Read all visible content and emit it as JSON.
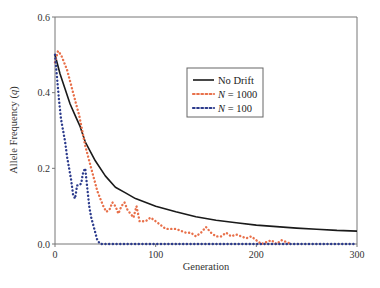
{
  "chart_data": {
    "type": "line",
    "title": "",
    "xlabel": "Generation",
    "ylabel": "Allele Frequency (q)",
    "xlim": [
      0,
      300
    ],
    "ylim": [
      0,
      0.6
    ],
    "x_ticks": [
      "0",
      "100",
      "200",
      "300"
    ],
    "y_ticks": [
      "0.0",
      "0.2",
      "0.4",
      "0.6"
    ],
    "grid": false,
    "legend_position": "upper-center-right",
    "series": [
      {
        "name": "No Drift",
        "style": "solid",
        "color": "#1a1a1a",
        "x": [
          0,
          5,
          10,
          15,
          20,
          25,
          30,
          40,
          50,
          60,
          70,
          80,
          100,
          120,
          140,
          160,
          180,
          200,
          220,
          240,
          260,
          280,
          300
        ],
        "values": [
          0.5,
          0.45,
          0.41,
          0.37,
          0.34,
          0.31,
          0.27,
          0.22,
          0.18,
          0.15,
          0.135,
          0.12,
          0.1,
          0.085,
          0.072,
          0.063,
          0.056,
          0.05,
          0.046,
          0.042,
          0.039,
          0.036,
          0.034
        ]
      },
      {
        "name": "N = 1000",
        "style": "dotted",
        "color": "#e8704a",
        "x": [
          0,
          3,
          6,
          9,
          12,
          15,
          18,
          21,
          24,
          27,
          30,
          33,
          36,
          39,
          42,
          45,
          48,
          51,
          54,
          57,
          60,
          63,
          66,
          69,
          72,
          75,
          78,
          81,
          84,
          87,
          90,
          95,
          100,
          105,
          110,
          115,
          120,
          125,
          130,
          135,
          140,
          145,
          150,
          155,
          160,
          165,
          170,
          175,
          180,
          185,
          190,
          195,
          200,
          205,
          210,
          215,
          220,
          225,
          230,
          235
        ],
        "values": [
          0.48,
          0.51,
          0.5,
          0.48,
          0.46,
          0.43,
          0.4,
          0.37,
          0.34,
          0.3,
          0.26,
          0.23,
          0.2,
          0.17,
          0.14,
          0.12,
          0.1,
          0.085,
          0.09,
          0.11,
          0.1,
          0.08,
          0.1,
          0.11,
          0.09,
          0.08,
          0.07,
          0.1,
          0.06,
          0.06,
          0.06,
          0.07,
          0.06,
          0.05,
          0.04,
          0.04,
          0.04,
          0.035,
          0.03,
          0.03,
          0.02,
          0.03,
          0.045,
          0.03,
          0.02,
          0.02,
          0.03,
          0.02,
          0.025,
          0.02,
          0.015,
          0.02,
          0.01,
          0.0,
          0.005,
          0.01,
          0.0,
          0.01,
          0.005,
          0.0
        ]
      },
      {
        "name": "N = 100",
        "style": "dotted",
        "color": "#2b3a8c",
        "x": [
          0,
          2,
          4,
          6,
          8,
          10,
          12,
          14,
          16,
          18,
          20,
          22,
          24,
          26,
          28,
          30,
          32,
          34,
          36,
          38,
          40,
          42,
          45,
          50,
          60,
          80,
          100,
          150,
          200,
          250,
          300
        ],
        "values": [
          0.5,
          0.44,
          0.38,
          0.33,
          0.3,
          0.27,
          0.23,
          0.2,
          0.17,
          0.13,
          0.12,
          0.155,
          0.155,
          0.16,
          0.19,
          0.2,
          0.15,
          0.1,
          0.07,
          0.05,
          0.03,
          0.01,
          0.0,
          0.0,
          0.0,
          0.0,
          0.0,
          0.0,
          0.0,
          0.0,
          0.0
        ]
      }
    ]
  },
  "axes": {
    "xlabel": "Generation",
    "ylabel_prefix": "Allele Frequency (",
    "ylabel_var": "q",
    "ylabel_suffix": ")",
    "x_ticks": [
      {
        "label": "0",
        "value": 0
      },
      {
        "label": "100",
        "value": 100
      },
      {
        "label": "200",
        "value": 200
      },
      {
        "label": "300",
        "value": 300
      }
    ],
    "y_ticks": [
      {
        "label": "0.0",
        "value": 0
      },
      {
        "label": "0.2",
        "value": 0.2
      },
      {
        "label": "0.4",
        "value": 0.4
      },
      {
        "label": "0.6",
        "value": 0.6
      }
    ]
  },
  "legend": {
    "items": [
      {
        "label": "No Drift",
        "var": "",
        "rest": "No Drift"
      },
      {
        "label": "N = 1000",
        "var": "N",
        "rest": " = 1000"
      },
      {
        "label": "N = 100",
        "var": "N",
        "rest": " = 100"
      }
    ]
  }
}
